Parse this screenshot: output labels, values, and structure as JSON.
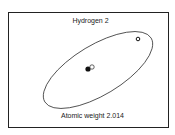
{
  "diagram": {
    "title": "Hydrogen 2",
    "caption": "Atomic weight 2.014",
    "nucleus": {
      "proton": "filled circle",
      "neutron": "open circle"
    },
    "orbit": "elliptical electron orbit",
    "electron": "small open circle on orbit"
  }
}
